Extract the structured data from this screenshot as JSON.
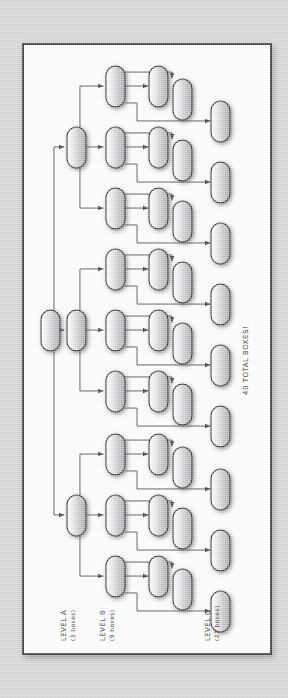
{
  "canvas": {
    "width": 288,
    "height": 698,
    "background_color": "#d5d5d5",
    "sheet_color": "#fdfdfd",
    "ink_color": "#3a3a3a"
  },
  "diagram": {
    "title_note": "40 TOTAL BOXES!",
    "orientation": "rotated-90-counterclockwise hand-drawn tree",
    "node_shape": "rounded-capsule",
    "levels": [
      {
        "id": "root",
        "label": "",
        "count": 1,
        "note": "unlabeled root box"
      },
      {
        "id": "level-a",
        "label": "LEVEL A",
        "sublabel": "(3 boxes)",
        "count": 3
      },
      {
        "id": "level-b",
        "label": "LEVEL B",
        "sublabel": "(9 boxes)",
        "count": 9
      },
      {
        "id": "level-c",
        "label": "LEVEL C",
        "sublabel": "(27 boxes)",
        "count": 27
      }
    ],
    "total_boxes": 40,
    "branching_factor": 3,
    "labels": {
      "level_a_line1": "LEVEL A",
      "level_a_line2": "(3 boxes)",
      "level_b_line1": "LEVEL B",
      "level_b_line2": "(9 boxes)",
      "level_c_line1": "LEVEL C",
      "level_c_line2": "(27 boxes)",
      "total": "40 TOTAL BOXES!"
    },
    "geometry": {
      "box_w": 18,
      "box_h": 40,
      "col_root": 18,
      "col_a": 44,
      "col_b": 83,
      "col_c1": 128,
      "col_c2": 152,
      "col_c3": 190,
      "a_centers": [
        102,
        285,
        470
      ],
      "b_span": 61,
      "c_offsets": [
        -20,
        0,
        20
      ]
    }
  }
}
